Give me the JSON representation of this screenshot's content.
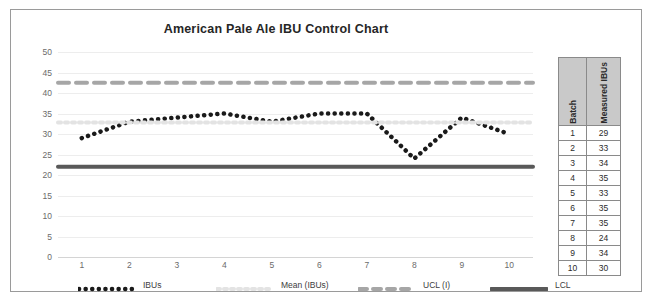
{
  "chart_data": {
    "type": "line",
    "title": "American Pale Ale IBU Control Chart",
    "xlabel": "",
    "ylabel": "",
    "categories": [
      "1",
      "2",
      "3",
      "4",
      "5",
      "6",
      "7",
      "8",
      "9",
      "10"
    ],
    "ylim": [
      0,
      50
    ],
    "y_ticks": [
      "0",
      "5",
      "10",
      "15",
      "20",
      "25",
      "30",
      "35",
      "40",
      "45",
      "50"
    ],
    "grid": true,
    "legend_position": "bottom",
    "series": [
      {
        "name": "IBUs",
        "style": "dotted",
        "color": "#1a1a1a",
        "values": [
          29,
          33,
          34,
          35,
          33,
          35,
          35,
          24,
          34,
          30
        ]
      },
      {
        "name": "Mean (IBUs)",
        "style": "dotted",
        "color": "#e3e3e3",
        "constant": 32.8
      },
      {
        "name": "UCL (I)",
        "style": "dashed",
        "color": "#a6a6a6",
        "constant": 42.5
      },
      {
        "name": "LCL",
        "style": "solid",
        "color": "#595959",
        "constant": 22
      }
    ]
  },
  "table": {
    "headers": [
      "Batch",
      "Measured IBUs"
    ],
    "rows": [
      [
        "1",
        "29"
      ],
      [
        "2",
        "33"
      ],
      [
        "3",
        "34"
      ],
      [
        "4",
        "35"
      ],
      [
        "5",
        "33"
      ],
      [
        "6",
        "35"
      ],
      [
        "7",
        "35"
      ],
      [
        "8",
        "24"
      ],
      [
        "9",
        "34"
      ],
      [
        "10",
        "30"
      ]
    ]
  },
  "colors": {
    "frame_border": "#9a9a9a",
    "gridline": "#ededed",
    "axis_text": "#6b6b6b",
    "title_text": "#262626",
    "table_header_bg": "#c9c9c9",
    "table_border": "#8a8a8a"
  }
}
